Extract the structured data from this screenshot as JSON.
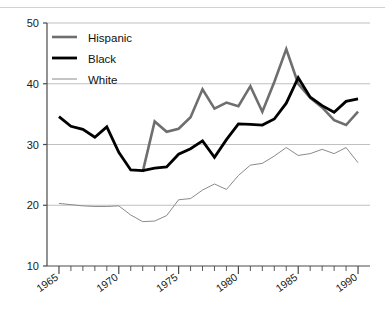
{
  "chart_data": {
    "type": "line",
    "title": "",
    "subtitle": "",
    "xlabel": "",
    "ylabel": "",
    "xlim": [
      1964,
      1991
    ],
    "ylim": [
      10,
      50
    ],
    "ytick_labels": [
      "10",
      "20",
      "30",
      "40",
      "50"
    ],
    "ytick_values": [
      10,
      20,
      30,
      40,
      50
    ],
    "xtick_labels": [
      "1965",
      "1970",
      "1975",
      "1980",
      "1985",
      "1990"
    ],
    "xtick_values": [
      1965,
      1970,
      1975,
      1980,
      1985,
      1990
    ],
    "minor_xticks_every": 1,
    "grid": "horizontal",
    "legend_position": "top-left",
    "x": [
      1965,
      1966,
      1967,
      1968,
      1969,
      1970,
      1971,
      1972,
      1973,
      1974,
      1975,
      1976,
      1977,
      1978,
      1979,
      1980,
      1981,
      1982,
      1983,
      1984,
      1985,
      1986,
      1987,
      1988,
      1989,
      1990
    ],
    "series": [
      {
        "name": "Hispanic",
        "color": "#6e6e6e",
        "width": 2.6,
        "x": [
          1972,
          1973,
          1974,
          1975,
          1976,
          1977,
          1978,
          1979,
          1980,
          1981,
          1982,
          1983,
          1984,
          1985,
          1986,
          1987,
          1988,
          1989,
          1990
        ],
        "values": [
          25.5,
          33.8,
          32.1,
          32.6,
          34.5,
          39.1,
          35.9,
          36.9,
          36.3,
          39.6,
          35.4,
          40.3,
          45.7,
          40.0,
          37.7,
          36.1,
          34.0,
          33.2,
          35.4
        ]
      },
      {
        "name": "Black",
        "color": "#000000",
        "width": 2.8,
        "x": [
          1965,
          1966,
          1967,
          1968,
          1969,
          1970,
          1971,
          1972,
          1973,
          1974,
          1975,
          1976,
          1977,
          1978,
          1979,
          1980,
          1981,
          1982,
          1983,
          1984,
          1985,
          1986,
          1987,
          1988,
          1989,
          1990
        ],
        "values": [
          34.6,
          33.0,
          32.5,
          31.2,
          32.9,
          28.7,
          25.8,
          25.7,
          26.1,
          26.3,
          28.4,
          29.3,
          30.6,
          27.9,
          30.8,
          33.4,
          33.3,
          33.2,
          34.2,
          36.8,
          41.0,
          37.8,
          36.4,
          35.3,
          37.1,
          37.5
        ]
      },
      {
        "name": "White",
        "color": "#8a8a8a",
        "width": 1.0,
        "x": [
          1965,
          1966,
          1967,
          1968,
          1969,
          1970,
          1971,
          1972,
          1973,
          1974,
          1975,
          1976,
          1977,
          1978,
          1979,
          1980,
          1981,
          1982,
          1983,
          1984,
          1985,
          1986,
          1987,
          1988,
          1989,
          1990
        ],
        "values": [
          20.3,
          20.1,
          19.9,
          19.8,
          19.8,
          19.9,
          18.4,
          17.3,
          17.4,
          18.3,
          20.9,
          21.1,
          22.5,
          23.5,
          22.6,
          24.9,
          26.6,
          26.9,
          28.1,
          29.5,
          28.2,
          28.5,
          29.2,
          28.5,
          29.5,
          27.0
        ]
      }
    ]
  },
  "legend": {
    "items": [
      {
        "label": "Hispanic"
      },
      {
        "label": "Black"
      },
      {
        "label": "White"
      }
    ]
  },
  "colors": {
    "hispanic": "#6e6e6e",
    "black": "#000000",
    "white": "#8a8a8a",
    "grid": "#b9b9b9",
    "axis": "#4a4a4a",
    "top_rule": "#cfcfcf"
  }
}
